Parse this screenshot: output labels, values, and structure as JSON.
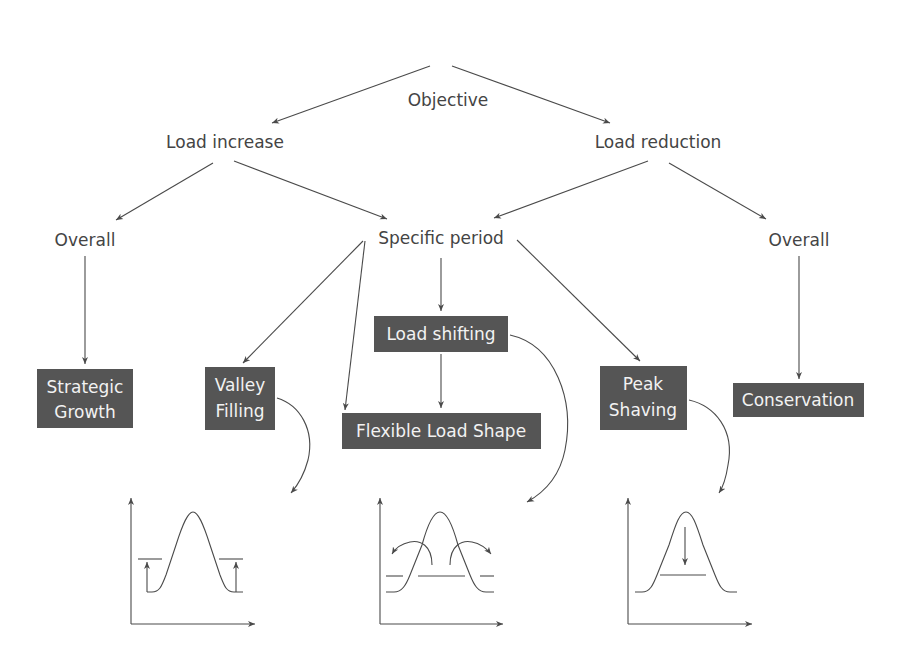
{
  "root": {
    "label": "Objective"
  },
  "level1": [
    {
      "id": "load-increase",
      "label": "Load increase"
    },
    {
      "id": "load-reduction",
      "label": "Load reduction"
    }
  ],
  "level2": [
    {
      "id": "overall-increase",
      "label": "Overall"
    },
    {
      "id": "specific-period",
      "label": "Specific period"
    },
    {
      "id": "overall-reduction",
      "label": "Overall"
    }
  ],
  "strategies": {
    "strategic_growth": {
      "line1": "Strategic",
      "line2": "Growth"
    },
    "valley_filling": {
      "line1": "Valley",
      "line2": "Filling"
    },
    "load_shifting": {
      "label": "Load shifting"
    },
    "flexible_load_shape": {
      "label": "Flexible Load Shape"
    },
    "peak_shaving": {
      "line1": "Peak",
      "line2": "Shaving"
    },
    "conservation": {
      "label": "Conservation"
    }
  },
  "plots": [
    {
      "id": "valley-filling-plot",
      "depicts": "valley filling"
    },
    {
      "id": "load-shifting-plot",
      "depicts": "load shifting"
    },
    {
      "id": "peak-shaving-plot",
      "depicts": "peak shaving"
    }
  ],
  "colors": {
    "box_fill": "#555555",
    "box_text": "#f2f2f2",
    "text": "#444444",
    "line": "#4a4a4a"
  }
}
